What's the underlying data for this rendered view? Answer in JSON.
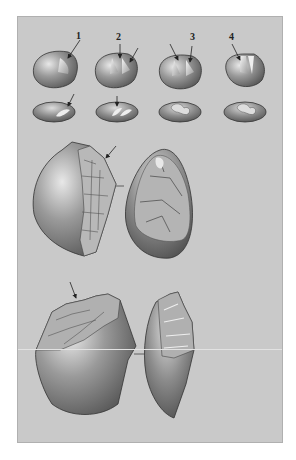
{
  "figure": {
    "background_color": "#c9c9c9",
    "stone_color": "#8a8a8a",
    "labels": [
      {
        "id": "1",
        "text": "1"
      },
      {
        "id": "2",
        "text": "2"
      },
      {
        "id": "3",
        "text": "3"
      },
      {
        "id": "4",
        "text": "4"
      }
    ],
    "rows": [
      {
        "name": "top-views",
        "count": 4
      },
      {
        "name": "plan-views",
        "count": 4
      },
      {
        "name": "middle-pair",
        "count": 2
      },
      {
        "name": "bottom-pair",
        "count": 2
      }
    ]
  }
}
